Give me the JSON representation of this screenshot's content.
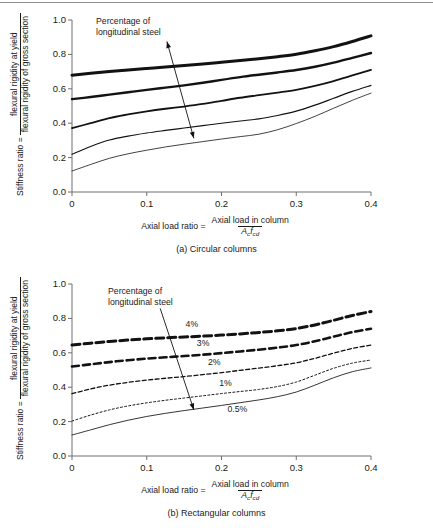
{
  "chart_data": [
    {
      "id": "a",
      "type": "line",
      "title": "(a) Circular columns",
      "xlabel_parts": {
        "lead": "Axial load ratio =",
        "numerator": "Axial load in column",
        "denominator": "A_c f_cd"
      },
      "ylabel_parts": {
        "lead": "Stiffness ratio =",
        "numerator": "flexural rigidity at yield",
        "denominator": "flexural rigidity of gross section"
      },
      "xlim": [
        0,
        0.4
      ],
      "ylim": [
        0,
        1.0
      ],
      "xticks": [
        0,
        0.1,
        0.2,
        0.3,
        0.4
      ],
      "xticklabels": [
        "0",
        "0.1",
        "0.2",
        "0.3",
        "0.4"
      ],
      "yticks": [
        0,
        0.2,
        0.4,
        0.6,
        0.8,
        1.0
      ],
      "yticklabels": [
        "0.0",
        "0.2",
        "0.4",
        "0.6",
        "0.8",
        "1.0"
      ],
      "grid": false,
      "legend": "none",
      "annotation": {
        "text_line1": "Percentage of",
        "text_line2": "longitudinal steel",
        "arrow_from": [
          0.127,
          0.875
        ],
        "arrow_to": [
          0.163,
          0.312
        ]
      },
      "series": [
        {
          "name": "4%",
          "style": "solid",
          "width": 3.0,
          "x": [
            0,
            0.025,
            0.05,
            0.075,
            0.1,
            0.125,
            0.15,
            0.175,
            0.2,
            0.225,
            0.25,
            0.275,
            0.3,
            0.325,
            0.35,
            0.375,
            0.4
          ],
          "y": [
            0.679,
            0.69,
            0.7,
            0.709,
            0.718,
            0.727,
            0.735,
            0.744,
            0.754,
            0.764,
            0.775,
            0.787,
            0.801,
            0.821,
            0.845,
            0.875,
            0.908
          ]
        },
        {
          "name": "3%",
          "style": "solid",
          "width": 2.4,
          "x": [
            0,
            0.025,
            0.05,
            0.075,
            0.1,
            0.125,
            0.15,
            0.175,
            0.2,
            0.225,
            0.25,
            0.275,
            0.3,
            0.325,
            0.35,
            0.375,
            0.4
          ],
          "y": [
            0.54,
            0.552,
            0.566,
            0.58,
            0.594,
            0.607,
            0.62,
            0.635,
            0.652,
            0.668,
            0.682,
            0.695,
            0.709,
            0.728,
            0.752,
            0.78,
            0.808
          ]
        },
        {
          "name": "2%",
          "style": "solid",
          "width": 1.8,
          "x": [
            0,
            0.025,
            0.05,
            0.075,
            0.1,
            0.125,
            0.15,
            0.175,
            0.2,
            0.225,
            0.25,
            0.275,
            0.3,
            0.325,
            0.35,
            0.375,
            0.4
          ],
          "y": [
            0.372,
            0.4,
            0.43,
            0.451,
            0.469,
            0.484,
            0.497,
            0.512,
            0.53,
            0.548,
            0.563,
            0.578,
            0.594,
            0.617,
            0.645,
            0.678,
            0.71
          ]
        },
        {
          "name": "1%",
          "style": "solid",
          "width": 1.15,
          "x": [
            0,
            0.025,
            0.05,
            0.075,
            0.1,
            0.125,
            0.15,
            0.175,
            0.2,
            0.225,
            0.25,
            0.275,
            0.3,
            0.325,
            0.35,
            0.375,
            0.4
          ],
          "y": [
            0.22,
            0.265,
            0.302,
            0.325,
            0.343,
            0.358,
            0.372,
            0.386,
            0.4,
            0.413,
            0.425,
            0.445,
            0.47,
            0.505,
            0.545,
            0.585,
            0.62
          ]
        },
        {
          "name": "0.5%",
          "style": "solid",
          "width": 0.8,
          "x": [
            0,
            0.025,
            0.05,
            0.075,
            0.1,
            0.125,
            0.15,
            0.175,
            0.2,
            0.225,
            0.25,
            0.275,
            0.3,
            0.325,
            0.35,
            0.375,
            0.4
          ],
          "y": [
            0.122,
            0.16,
            0.196,
            0.222,
            0.243,
            0.262,
            0.278,
            0.293,
            0.308,
            0.322,
            0.336,
            0.362,
            0.398,
            0.44,
            0.487,
            0.533,
            0.575
          ]
        }
      ]
    },
    {
      "id": "b",
      "type": "line",
      "title": "(b) Rectangular columns",
      "xlabel_parts": {
        "lead": "Axial load ratio =",
        "numerator": "Axial load in column",
        "denominator": "A_c f_cd"
      },
      "ylabel_parts": {
        "lead": "Stiffness ratio =",
        "numerator": "flexural rigidity at yield",
        "denominator": "flexural rigidity of gross section"
      },
      "xlim": [
        0,
        0.4
      ],
      "ylim": [
        0,
        1.0
      ],
      "xticks": [
        0,
        0.1,
        0.2,
        0.3,
        0.4
      ],
      "xticklabels": [
        "0",
        "0.1",
        "0.2",
        "0.3",
        "0.4"
      ],
      "yticks": [
        0,
        0.2,
        0.4,
        0.6,
        0.8,
        1.0
      ],
      "yticklabels": [
        "0.0",
        "0.2",
        "0.4",
        "0.6",
        "0.8",
        "1.0"
      ],
      "grid": false,
      "legend": "inline-labels",
      "annotation": {
        "text_line1": "Percentage of",
        "text_line2": "longitudinal steel",
        "arrow_from": [
          0.118,
          0.858
        ],
        "arrow_to": [
          0.163,
          0.268
        ]
      },
      "series": [
        {
          "name": "4%",
          "style": "dashed-bold",
          "width": 3.0,
          "dash": "8,4",
          "label_at": [
            0.152,
            0.762
          ],
          "x": [
            0,
            0.025,
            0.05,
            0.075,
            0.1,
            0.125,
            0.15,
            0.175,
            0.2,
            0.225,
            0.25,
            0.275,
            0.3,
            0.325,
            0.35,
            0.375,
            0.4
          ],
          "y": [
            0.645,
            0.656,
            0.666,
            0.674,
            0.681,
            0.687,
            0.692,
            0.697,
            0.703,
            0.71,
            0.718,
            0.728,
            0.741,
            0.762,
            0.789,
            0.817,
            0.84
          ]
        },
        {
          "name": "3%",
          "style": "dashed-bold",
          "width": 2.6,
          "dash": "7,4",
          "label_at": [
            0.167,
            0.65
          ],
          "x": [
            0,
            0.025,
            0.05,
            0.075,
            0.1,
            0.125,
            0.15,
            0.175,
            0.2,
            0.225,
            0.25,
            0.275,
            0.3,
            0.325,
            0.35,
            0.375,
            0.4
          ],
          "y": [
            0.52,
            0.533,
            0.546,
            0.557,
            0.566,
            0.574,
            0.581,
            0.589,
            0.598,
            0.608,
            0.618,
            0.63,
            0.645,
            0.667,
            0.694,
            0.72,
            0.74
          ]
        },
        {
          "name": "2%",
          "style": "dashed-fine",
          "width": 1.3,
          "dash": "4,2.5",
          "label_at": [
            0.182,
            0.538
          ],
          "x": [
            0,
            0.025,
            0.05,
            0.075,
            0.1,
            0.125,
            0.15,
            0.175,
            0.2,
            0.225,
            0.25,
            0.275,
            0.3,
            0.325,
            0.35,
            0.375,
            0.4
          ],
          "y": [
            0.362,
            0.39,
            0.412,
            0.428,
            0.441,
            0.452,
            0.462,
            0.473,
            0.485,
            0.498,
            0.511,
            0.525,
            0.542,
            0.568,
            0.598,
            0.625,
            0.645
          ]
        },
        {
          "name": "1%",
          "style": "dotted",
          "width": 1.0,
          "dash": "2,2.2",
          "label_at": [
            0.197,
            0.418
          ],
          "x": [
            0,
            0.025,
            0.05,
            0.075,
            0.1,
            0.125,
            0.15,
            0.175,
            0.2,
            0.225,
            0.25,
            0.275,
            0.3,
            0.325,
            0.35,
            0.375,
            0.4
          ],
          "y": [
            0.203,
            0.238,
            0.268,
            0.291,
            0.309,
            0.324,
            0.337,
            0.35,
            0.363,
            0.375,
            0.387,
            0.404,
            0.43,
            0.47,
            0.51,
            0.54,
            0.558
          ]
        },
        {
          "name": "0.5%",
          "style": "solid-thin",
          "width": 0.85,
          "label_at": [
            0.208,
            0.265
          ],
          "x": [
            0,
            0.025,
            0.05,
            0.075,
            0.1,
            0.125,
            0.15,
            0.175,
            0.2,
            0.225,
            0.25,
            0.275,
            0.3,
            0.325,
            0.35,
            0.375,
            0.4
          ],
          "y": [
            0.122,
            0.152,
            0.182,
            0.208,
            0.23,
            0.248,
            0.264,
            0.279,
            0.294,
            0.31,
            0.326,
            0.345,
            0.372,
            0.412,
            0.455,
            0.49,
            0.512
          ]
        }
      ]
    }
  ]
}
